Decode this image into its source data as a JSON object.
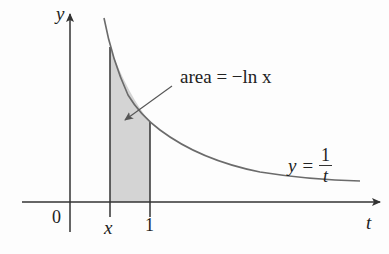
{
  "figure": {
    "type": "calculus-area-diagram",
    "axes": {
      "vertical_label": "y",
      "horizontal_label": "t",
      "origin_label": "0"
    },
    "ticks": [
      {
        "label": "x",
        "italic": true
      },
      {
        "label": "1",
        "italic": false
      }
    ],
    "curve": {
      "equation_lhs": "y =",
      "numerator": "1",
      "denominator": "t",
      "color": "#6b6b6b"
    },
    "shaded_region": {
      "from": "x",
      "to": "1",
      "fill": "#d4d4d4",
      "annotation": "area = −ln x"
    },
    "colors": {
      "axis": "#333333",
      "shading": "#d4d4d4",
      "background": "#ffffff"
    }
  }
}
